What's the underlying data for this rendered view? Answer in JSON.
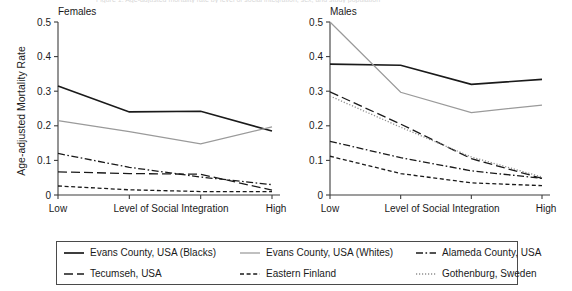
{
  "figure": {
    "top_clipped_caption": "Figure 1. Age-adjusted mortality rate by level of social integration, sex, and study population",
    "panels": [
      {
        "id": "females",
        "title": "Females"
      },
      {
        "id": "males",
        "title": "Males"
      }
    ],
    "axes": {
      "ylabel": "Age-adjusted Mortality Rate",
      "xlabel": "Level of Social Integration",
      "ytick_labels": [
        "0",
        "0.1",
        "0.2",
        "0.3",
        "0.4",
        "0.5"
      ],
      "xtick_labels": [
        "Low",
        "",
        "",
        "High"
      ]
    }
  },
  "legend": {
    "items": [
      {
        "label": "Evans County, USA (Blacks)",
        "style": "solid-black",
        "color": "#1a1a1a"
      },
      {
        "label": "Evans County, USA (Whites)",
        "style": "solid-gray",
        "color": "#9a9a9a"
      },
      {
        "label": "Alameda County, USA",
        "style": "dash-dot",
        "color": "#1a1a1a"
      },
      {
        "label": "Tecumseh, USA",
        "style": "long-dash",
        "color": "#1a1a1a"
      },
      {
        "label": "Eastern Finland",
        "style": "short-dash",
        "color": "#1a1a1a"
      },
      {
        "label": "Gothenburg, Sweden",
        "style": "dotted",
        "color": "#8e8e8e"
      }
    ]
  },
  "chart_data": [
    {
      "type": "line",
      "title": "Females",
      "xlabel": "Level of Social Integration",
      "ylabel": "Age-adjusted Mortality Rate",
      "categories": [
        "Low",
        "2",
        "3",
        "High"
      ],
      "xtick_labels": [
        "Low",
        "",
        "",
        "High"
      ],
      "ylim": [
        0,
        0.5
      ],
      "yticks": [
        0,
        0.1,
        0.2,
        0.3,
        0.4,
        0.5
      ],
      "grid": false,
      "legend_position": "bottom",
      "series": [
        {
          "name": "Evans County, USA (Blacks)",
          "style": "solid-black",
          "color": "#1a1a1a",
          "values": [
            0.315,
            0.24,
            0.242,
            0.185
          ]
        },
        {
          "name": "Evans County, USA (Whites)",
          "style": "solid-gray",
          "color": "#9a9a9a",
          "values": [
            0.215,
            0.183,
            0.148,
            0.197
          ]
        },
        {
          "name": "Alameda County, USA",
          "style": "dash-dot",
          "color": "#1a1a1a",
          "values": [
            0.12,
            0.08,
            0.052,
            0.03
          ]
        },
        {
          "name": "Tecumseh, USA",
          "style": "long-dash",
          "color": "#1a1a1a",
          "values": [
            0.067,
            0.062,
            0.06,
            0.014
          ]
        },
        {
          "name": "Eastern Finland",
          "style": "short-dash",
          "color": "#1a1a1a",
          "values": [
            0.026,
            0.015,
            0.01,
            0.01
          ]
        },
        {
          "name": "Gothenburg, Sweden",
          "style": "dotted",
          "color": "#8e8e8e",
          "values": [
            null,
            null,
            null,
            null
          ]
        }
      ]
    },
    {
      "type": "line",
      "title": "Males",
      "xlabel": "Level of Social Integration",
      "ylabel": "",
      "categories": [
        "Low",
        "2",
        "3",
        "High"
      ],
      "xtick_labels": [
        "Low",
        "",
        "",
        "High"
      ],
      "ylim": [
        0,
        0.5
      ],
      "yticks": [
        0,
        0.1,
        0.2,
        0.3,
        0.4,
        0.5
      ],
      "grid": false,
      "legend_position": "bottom",
      "series": [
        {
          "name": "Evans County, USA (Blacks)",
          "style": "solid-black",
          "color": "#1a1a1a",
          "values": [
            0.378,
            0.375,
            0.32,
            0.334
          ]
        },
        {
          "name": "Evans County, USA (Whites)",
          "style": "solid-gray",
          "color": "#9a9a9a",
          "values": [
            0.5,
            0.297,
            0.238,
            0.26
          ]
        },
        {
          "name": "Tecumseh, USA",
          "style": "long-dash",
          "color": "#1a1a1a",
          "values": [
            0.298,
            0.205,
            0.105,
            0.048
          ]
        },
        {
          "name": "Gothenburg, Sweden",
          "style": "dotted",
          "color": "#8e8e8e",
          "values": [
            0.286,
            0.196,
            0.11,
            0.052
          ]
        },
        {
          "name": "Alameda County, USA",
          "style": "dash-dot",
          "color": "#1a1a1a",
          "values": [
            0.155,
            0.108,
            0.07,
            0.048
          ]
        },
        {
          "name": "Eastern Finland",
          "style": "short-dash",
          "color": "#1a1a1a",
          "values": [
            0.112,
            0.062,
            0.035,
            0.027
          ]
        }
      ]
    }
  ]
}
